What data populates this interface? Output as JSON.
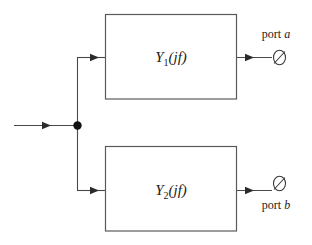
{
  "diagram": {
    "background_color": "#ffffff",
    "line_color": "#4a4a4a",
    "box_border_color": "#5a5a5a",
    "text_color": "#1a1a1a",
    "blocks": [
      {
        "id": "block-y1",
        "label_main": "Y",
        "label_subscript": "1",
        "label_arg": "(jf)",
        "label_full": "Y1(jf)"
      },
      {
        "id": "block-y2",
        "label_main": "Y",
        "label_subscript": "2",
        "label_arg": "(jf)",
        "label_full": "Y2(jf)"
      }
    ],
    "ports": [
      {
        "id": "port-a",
        "label_text": "port",
        "label_name": "a",
        "terminal_glyph": "∅",
        "position": "above-line"
      },
      {
        "id": "port-b",
        "label_text": "port",
        "label_name": "b",
        "terminal_glyph": "∅",
        "position": "below-line"
      }
    ],
    "nodes": {
      "junction_name": "signal-split-node"
    }
  }
}
